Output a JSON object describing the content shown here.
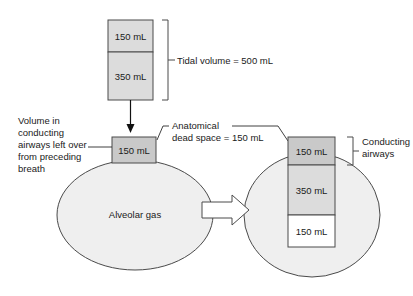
{
  "diagram": {
    "colors": {
      "dark_gray": "#c9c9c9",
      "mid_gray": "#dcdcdc",
      "light_gray": "#ededed",
      "circle_fill": "#efefef",
      "white": "#ffffff",
      "outline": "#4a4a4a",
      "text": "#1a1a1a"
    },
    "inspired_stack": {
      "top_segment_label": "150 mL",
      "bottom_segment_label": "350 mL"
    },
    "brackets": {
      "tidal_volume": "Tidal volume = 500 mL",
      "conducting_airways_line1": "Conducting",
      "conducting_airways_line2": "airways"
    },
    "labels": {
      "leftover_line1": "Volume in",
      "leftover_line2": "conducting",
      "leftover_line3": "airways left over",
      "leftover_line4": "from preceding",
      "leftover_line5": "breath",
      "dead_space_line1": "Anatomical",
      "dead_space_line2": "dead space = 150 mL",
      "alveolar_gas": "Alveolar gas"
    },
    "left_airway_box": {
      "label": "150 mL"
    },
    "right_stack": {
      "segments": [
        {
          "label": "150 mL"
        },
        {
          "label": "350 mL"
        },
        {
          "label": "150 mL"
        }
      ]
    }
  }
}
